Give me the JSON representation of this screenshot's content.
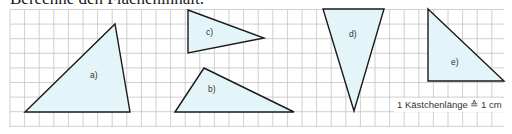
{
  "heading": "Berechne den Flächeninhalt.",
  "grid": {
    "origin_x": 10,
    "origin_y": 9.5,
    "cell": 14.6,
    "cols": 34,
    "rows": 8,
    "right": 504,
    "bottom": 127,
    "line_color": "#c4c4c4"
  },
  "fill_color": "#e3f5f8",
  "stroke_color": "#1a1a1a",
  "triangles": [
    {
      "id": "a",
      "label": "a)",
      "points": [
        [
          25,
          112
        ],
        [
          115,
          24
        ],
        [
          130,
          112
        ]
      ],
      "label_pos": [
        90,
        78
      ]
    },
    {
      "id": "b",
      "label": "b)",
      "points": [
        [
          175,
          112
        ],
        [
          204,
          68
        ],
        [
          294,
          112
        ]
      ],
      "label_pos": [
        208,
        92
      ]
    },
    {
      "id": "c",
      "label": "c)",
      "points": [
        [
          188,
          10
        ],
        [
          264,
          38
        ],
        [
          188,
          53
        ]
      ],
      "label_pos": [
        206,
        35
      ]
    },
    {
      "id": "d",
      "label": "d)",
      "points": [
        [
          323,
          9
        ],
        [
          384,
          9
        ],
        [
          354,
          111
        ]
      ],
      "label_pos": [
        349,
        37
      ]
    },
    {
      "id": "e",
      "label": "e)",
      "points": [
        [
          428,
          9
        ],
        [
          504,
          81
        ],
        [
          428,
          81
        ]
      ],
      "label_pos": [
        451,
        65
      ]
    }
  ],
  "scale_note": "1 Kästchenlänge ≙ 1 cm"
}
